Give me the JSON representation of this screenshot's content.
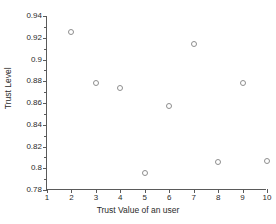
{
  "chart_data": {
    "type": "scatter",
    "title": "",
    "xlabel": "Trust Value of an user",
    "ylabel": "Trust Level",
    "xlim": [
      1,
      10
    ],
    "ylim": [
      0.78,
      0.94
    ],
    "xticks": [
      1,
      2,
      3,
      4,
      5,
      6,
      7,
      8,
      9,
      10
    ],
    "xtick_labels": [
      "1",
      "2",
      "3",
      "4",
      "5",
      "6",
      "7",
      "8",
      "9",
      "10"
    ],
    "yticks": [
      0.78,
      0.8,
      0.82,
      0.84,
      0.86,
      0.88,
      0.9,
      0.92,
      0.94
    ],
    "ytick_labels": [
      "0.78",
      "0.8",
      "0.82",
      "0.84",
      "0.86",
      "0.88",
      "0.9",
      "0.92",
      "0.94"
    ],
    "grid": false,
    "legend": null,
    "marker": "open-circle",
    "marker_color": "#8e8e8e",
    "axis_color": "#5a5a5a",
    "x": [
      2,
      3,
      4,
      5,
      6,
      7,
      8,
      9,
      10
    ],
    "y": [
      0.9255,
      0.8782,
      0.8736,
      0.7955,
      0.8573,
      0.9145,
      0.8055,
      0.8782,
      0.8064
    ],
    "points": [
      {
        "x": 2,
        "y": 0.9255
      },
      {
        "x": 3,
        "y": 0.8782
      },
      {
        "x": 4,
        "y": 0.8736
      },
      {
        "x": 5,
        "y": 0.7955
      },
      {
        "x": 6,
        "y": 0.8573
      },
      {
        "x": 7,
        "y": 0.9145
      },
      {
        "x": 8,
        "y": 0.8055
      },
      {
        "x": 9,
        "y": 0.8782
      },
      {
        "x": 10,
        "y": 0.8064
      }
    ]
  }
}
